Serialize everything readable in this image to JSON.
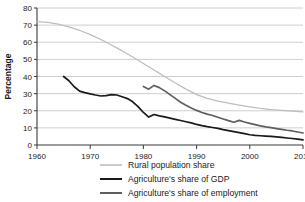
{
  "chart_data": {
    "type": "line",
    "title": "",
    "xlabel": "",
    "ylabel": "Percentage",
    "xlim": [
      1960,
      2010
    ],
    "ylim": [
      0,
      80
    ],
    "xticks": [
      1960,
      1970,
      1980,
      1990,
      2000,
      2010
    ],
    "yticks": [
      0,
      10,
      20,
      30,
      40,
      50,
      60,
      70,
      80
    ],
    "grid": "horizontal",
    "legend_position": "bottom",
    "series": [
      {
        "name": "Rural population share",
        "color": "#bdbdbd",
        "width": 1.3,
        "x": [
          1960,
          1962,
          1964,
          1966,
          1968,
          1970,
          1972,
          1974,
          1976,
          1978,
          1980,
          1982,
          1984,
          1986,
          1988,
          1990,
          1992,
          1994,
          1996,
          1998,
          2000,
          2002,
          2004,
          2006,
          2008,
          2010
        ],
        "y": [
          72.0,
          71.6,
          70.6,
          69.0,
          67.0,
          64.5,
          61.6,
          58.4,
          55.0,
          51.4,
          47.6,
          43.8,
          40.0,
          36.2,
          32.6,
          29.4,
          27.2,
          25.6,
          24.4,
          23.3,
          22.3,
          21.4,
          20.7,
          20.2,
          19.8,
          19.4
        ]
      },
      {
        "name": "Agriculture's share of GDP",
        "color": "#1a1a1a",
        "width": 1.7,
        "x": [
          1965,
          1966,
          1967,
          1968,
          1969,
          1970,
          1971,
          1972,
          1973,
          1974,
          1975,
          1976,
          1977,
          1978,
          1979,
          1980,
          1981,
          1982,
          1983,
          1984,
          1985,
          1986,
          1987,
          1988,
          1989,
          1990,
          1991,
          1992,
          1993,
          1994,
          1995,
          1996,
          1997,
          1998,
          1999,
          2000,
          2001,
          2002,
          2003,
          2004,
          2005,
          2006,
          2007,
          2008,
          2009,
          2010
        ],
        "y": [
          40.0,
          37.5,
          34.0,
          31.5,
          30.6,
          29.9,
          29.2,
          28.6,
          28.8,
          29.4,
          29.2,
          28.2,
          27.1,
          25.2,
          22.4,
          19.0,
          16.3,
          17.8,
          17.0,
          16.4,
          15.7,
          15.0,
          14.3,
          13.6,
          12.9,
          12.0,
          11.3,
          10.7,
          10.2,
          9.7,
          9.0,
          8.4,
          7.8,
          7.2,
          6.6,
          6.0,
          5.6,
          5.4,
          5.2,
          5.0,
          4.7,
          4.4,
          4.1,
          3.8,
          3.4,
          3.0
        ]
      },
      {
        "name": "Agriculture's share of employment",
        "color": "#5e5e5e",
        "width": 1.7,
        "x": [
          1980,
          1981,
          1982,
          1983,
          1984,
          1985,
          1986,
          1987,
          1988,
          1989,
          1990,
          1991,
          1992,
          1993,
          1994,
          1995,
          1996,
          1997,
          1998,
          1999,
          2000,
          2001,
          2002,
          2003,
          2004,
          2005,
          2006,
          2007,
          2008,
          2009,
          2010
        ],
        "y": [
          34.2,
          32.6,
          34.8,
          33.5,
          31.6,
          29.4,
          27.2,
          25.0,
          23.2,
          21.6,
          20.2,
          19.0,
          18.0,
          17.2,
          16.2,
          15.2,
          14.2,
          13.3,
          14.4,
          13.4,
          12.6,
          11.9,
          11.2,
          10.6,
          10.1,
          9.6,
          9.1,
          8.6,
          8.2,
          7.6,
          7.0
        ]
      }
    ]
  },
  "legend": {
    "items": [
      {
        "label": "Rural population share"
      },
      {
        "label": "Agriculture's share of GDP"
      },
      {
        "label": "Agriculture's share of employment"
      }
    ]
  }
}
